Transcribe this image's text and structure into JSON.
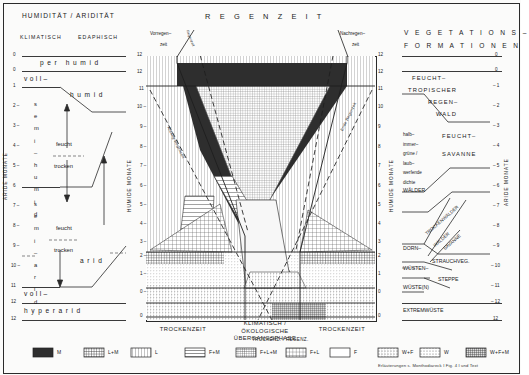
{
  "figure": {
    "left_panel": {
      "title": "HUMIDITÄT / ARIDITÄT",
      "col_headers": [
        "KLIMATISCH",
        "EDAPHISCH"
      ],
      "axis_label": "ARIDE MONATE",
      "axis_ticks": [
        "0",
        "0",
        "1",
        "2",
        "3",
        "4",
        "5",
        "6",
        "7",
        "8",
        "9",
        "10",
        "11",
        "12",
        "12"
      ],
      "zones": [
        {
          "name": "per humid",
          "style": "spaced"
        },
        {
          "name": "voll–",
          "style": "spaced"
        },
        {
          "name": "humid",
          "style": "spaced"
        },
        {
          "name": "semi–humid",
          "style": "vertical"
        },
        {
          "name": "semi–arid",
          "style": "vertical"
        },
        {
          "name": "arid",
          "style": "spaced"
        },
        {
          "name": "voll–",
          "style": "spaced"
        },
        {
          "name": "hyperarid",
          "style": "spaced"
        }
      ],
      "edaphic_pairs": [
        {
          "wet": "feucht",
          "dry": "trocken"
        },
        {
          "wet": "feucht",
          "dry": "trocken"
        }
      ]
    },
    "center_panel": {
      "title": "R E G E N Z E I T",
      "left_axis_label": "HUMIDE MONATE",
      "right_axis_label": "HUMIDE MONATE",
      "axis_ticks": [
        "12",
        "12",
        "11",
        "10",
        "9",
        "8",
        "7",
        "6",
        "5",
        "4",
        "3",
        "2",
        "1",
        "0",
        "0"
      ],
      "top_labels": [
        {
          "line1": "Vorregen–",
          "line2": "zeit"
        },
        {
          "line1": "Nachregen–",
          "line2": "zeit"
        }
      ],
      "diagonal_labels": [
        "Anfang Regenzeit",
        "Ende Regenzeit"
      ],
      "bottom_labels": [
        "TROCKENZEIT",
        "KLIMATISCH /\nÖKOLOGISCHE\nÜBERGANGSPHASE",
        "TROCKENZEIT"
      ],
      "bottom_sublabel": "TROCKENZ. / REGENZ."
    },
    "right_panel": {
      "title_line1": "V E G E T A T I O N S –",
      "title_line2": "F O R M A T I O N E N",
      "axis_label": "ARIDE MONATE",
      "axis_ticks": [
        "0",
        "0",
        "1",
        "2",
        "3",
        "4",
        "5",
        "6",
        "7",
        "8",
        "9",
        "10",
        "11",
        "12",
        "12"
      ],
      "formations": [
        "FEUCHT–",
        "TROPISCHER",
        "REGEN–",
        "WALD",
        "FEUCHT–",
        "SAVANNE",
        "halb–",
        "immer–",
        "grüne /",
        "laub–",
        "werfende",
        "dichte",
        "WÄLDER",
        "TROCKENWÄLDER",
        "WÄLDER",
        "SAVANNE",
        "DORN–",
        "STRAUCHVEG.",
        "WÜSTEN–",
        "STEPPE",
        "WÜSTE(N)",
        "EXTREMWÜSTE"
      ]
    },
    "legend": {
      "title": "",
      "items": [
        {
          "label": "M",
          "pattern": "solid-dark"
        },
        {
          "label": "L+M",
          "pattern": "grid-dense"
        },
        {
          "label": "L",
          "pattern": "vertical"
        },
        {
          "label": "F+M",
          "pattern": "horizontal-dash"
        },
        {
          "label": "F+L+M",
          "pattern": "grid-fine"
        },
        {
          "label": "F+L",
          "pattern": "grid-med"
        },
        {
          "label": "F",
          "pattern": "blank"
        },
        {
          "label": "W+F",
          "pattern": "dotted-grid"
        },
        {
          "label": "W",
          "pattern": "dotted"
        },
        {
          "label": "W+F+M",
          "pattern": "dense-mixed"
        }
      ],
      "footnote": "Erläuterungen s. Monthodiareck I Fig. 4 I und Text"
    }
  }
}
